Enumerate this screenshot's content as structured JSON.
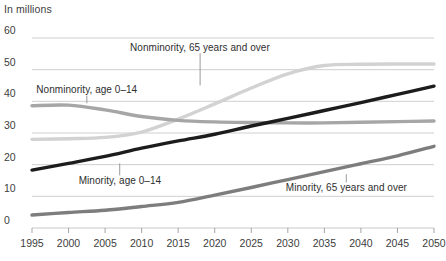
{
  "chart_data": {
    "type": "line",
    "title": "",
    "subtitle": "",
    "unit_label": "In millions",
    "xlabel": "",
    "ylabel": "",
    "xlim": [
      1995,
      2050
    ],
    "ylim": [
      0,
      60
    ],
    "grid": true,
    "grid_axis": "y",
    "legend_position": "inline-annotations",
    "x": [
      1995,
      2000,
      2005,
      2010,
      2015,
      2020,
      2025,
      2030,
      2035,
      2040,
      2045,
      2050
    ],
    "xticks": [
      "1995",
      "2000",
      "2005",
      "2010",
      "2015",
      "2020",
      "2025",
      "2030",
      "2035",
      "2040",
      "2045",
      "2050"
    ],
    "yticks": [
      "0",
      "10",
      "20",
      "30",
      "40",
      "50",
      "60"
    ],
    "ytick_values": [
      0,
      10,
      20,
      30,
      40,
      50,
      60
    ],
    "series": [
      {
        "name": "Nonminority, 65 years and over",
        "color": "#d2d2d2",
        "values": [
          28.0,
          28.2,
          28.6,
          30.3,
          34.4,
          39.2,
          44.2,
          48.7,
          51.3,
          51.7,
          51.8,
          51.8
        ],
        "label_x": 2018,
        "label_y": 57.0,
        "leader_from_y": 55.2,
        "leader_to_y": 45.0
      },
      {
        "name": "Nonminority, age 0–14",
        "color": "#a6a6a6",
        "values": [
          38.6,
          38.8,
          37.3,
          35.2,
          34.0,
          33.5,
          33.3,
          33.2,
          33.2,
          33.4,
          33.6,
          33.8
        ],
        "label_x": 2002.5,
        "label_y": 43.5,
        "leader_from_y": 41.8,
        "leader_to_y": 39.4
      },
      {
        "name": "Minority, age 0–14",
        "color": "#1c1c1c",
        "values": [
          18.3,
          20.4,
          22.6,
          25.2,
          27.5,
          29.6,
          32.2,
          34.6,
          37.1,
          39.6,
          42.2,
          44.8
        ],
        "label_x": 2007,
        "label_y": 14.8,
        "leader_from_y": 16.6,
        "leader_to_y": 20.4
      },
      {
        "name": "Minority, 65 years and over",
        "color": "#7d7d7d",
        "values": [
          4.1,
          4.9,
          5.6,
          6.8,
          8.1,
          10.4,
          12.8,
          15.3,
          17.8,
          20.3,
          22.8,
          25.8
        ],
        "label_x": 2038,
        "label_y": 12.5,
        "leader_from_y": 14.4,
        "leader_to_y": 17.0
      }
    ]
  },
  "plot_geometry": {
    "left": 32,
    "right": 434,
    "top": 38,
    "bottom": 228
  }
}
